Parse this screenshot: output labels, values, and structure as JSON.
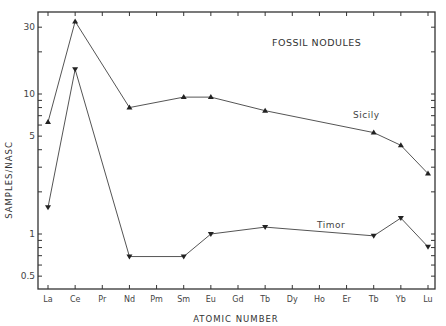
{
  "chart_data": {
    "type": "line",
    "title": "FOSSIL NODULES",
    "xlabel": "ATOMIC NUMBER",
    "ylabel": "SAMPLES/NASC",
    "yscale": "log",
    "ylim": [
      0.4,
      40
    ],
    "ytick_labels": [
      "0.5",
      "1",
      "5",
      "10",
      "30"
    ],
    "grid": false,
    "categories": [
      "La",
      "Ce",
      "Pr",
      "Nd",
      "Pm",
      "Sm",
      "Eu",
      "Gd",
      "Tb",
      "Dy",
      "Ho",
      "Er",
      "Tb",
      "Yb",
      "Lu"
    ],
    "series": [
      {
        "name": "Sicily",
        "marker": "triangle-up",
        "values": [
          6.3,
          33,
          null,
          8.0,
          null,
          9.5,
          9.5,
          null,
          7.6,
          null,
          null,
          null,
          5.3,
          4.3,
          2.7
        ]
      },
      {
        "name": "Timor",
        "marker": "triangle-down",
        "values": [
          1.55,
          15,
          null,
          0.69,
          null,
          0.69,
          1.0,
          null,
          1.12,
          null,
          null,
          null,
          0.97,
          1.3,
          0.81
        ]
      }
    ],
    "annotations": [
      "Sicily",
      "Timor"
    ]
  }
}
